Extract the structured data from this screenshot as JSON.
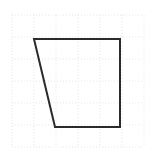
{
  "figure": {
    "background_color": "#ffffff",
    "width": 147,
    "height": 156
  },
  "grid": {
    "visible": true,
    "line_color": "#e6e6e8",
    "line_width": 1,
    "dash_pattern": "1 2",
    "cell_size": 22,
    "origin_x": 12,
    "origin_y": 15,
    "columns": 6,
    "rows": 6,
    "x_positions": [
      12,
      34,
      56,
      78,
      100,
      122,
      144
    ],
    "y_positions": [
      15,
      37,
      59,
      81,
      103,
      125,
      147
    ]
  },
  "shape": {
    "name": "quadrilateral",
    "type": "polygon",
    "stroke_color": "#2b2b2b",
    "stroke_width": 2,
    "fill": "none",
    "vertex_count": 4,
    "points": "34,39 120,39 120,127 55,127",
    "vertices": [
      {
        "label": "top-left",
        "x": 34,
        "y": 39
      },
      {
        "label": "top-right",
        "x": 120,
        "y": 39
      },
      {
        "label": "bottom-right",
        "x": 120,
        "y": 127
      },
      {
        "label": "bottom-left",
        "x": 55,
        "y": 127
      }
    ],
    "edges": [
      {
        "label": "top-edge",
        "from": "top-left",
        "to": "top-right"
      },
      {
        "label": "right-edge",
        "from": "top-right",
        "to": "bottom-right"
      },
      {
        "label": "bottom-edge",
        "from": "bottom-right",
        "to": "bottom-left"
      },
      {
        "label": "left-edge",
        "from": "bottom-left",
        "to": "top-left"
      }
    ]
  }
}
